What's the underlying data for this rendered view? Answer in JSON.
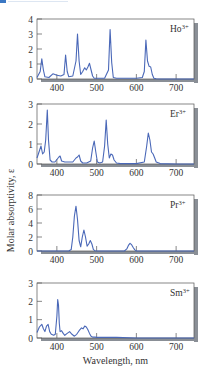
{
  "chart_data": [
    {
      "type": "line",
      "ion_label": "Ho",
      "ion_charge": "3+",
      "xlim": [
        350,
        745
      ],
      "ylim": [
        0,
        4
      ],
      "yticks": [
        "0",
        "1",
        "2",
        "3",
        "4"
      ],
      "xticks": [
        "400",
        "500",
        "600",
        "700"
      ],
      "x": [
        350,
        358,
        362,
        366,
        370,
        380,
        390,
        400,
        410,
        418,
        422,
        426,
        430,
        440,
        448,
        452,
        456,
        460,
        465,
        470,
        474,
        478,
        482,
        486,
        490,
        494,
        500,
        510,
        520,
        530,
        534,
        538,
        542,
        550,
        560,
        580,
        600,
        615,
        620,
        624,
        628,
        632,
        636,
        640,
        644,
        650,
        660,
        700,
        745
      ],
      "values": [
        0.1,
        0.5,
        1.35,
        0.6,
        0.15,
        0.1,
        0.35,
        0.25,
        0.2,
        0.3,
        1.6,
        0.5,
        0.15,
        0.2,
        1.2,
        3.0,
        1.2,
        0.3,
        0.5,
        0.75,
        0.6,
        0.8,
        1.05,
        0.6,
        0.2,
        0.05,
        0.05,
        0.05,
        0.05,
        0.6,
        3.3,
        1.1,
        0.1,
        0.05,
        0.05,
        0.05,
        0.05,
        0.1,
        0.5,
        2.6,
        1.2,
        0.85,
        0.8,
        0.3,
        0.05,
        0.02,
        0.0,
        0.0,
        0.0
      ]
    },
    {
      "type": "line",
      "ion_label": "Er",
      "ion_charge": "3+",
      "xlim": [
        350,
        745
      ],
      "ylim": [
        0,
        3
      ],
      "yticks": [
        "0",
        "1",
        "2",
        "3"
      ],
      "xticks": [
        "400",
        "500",
        "600",
        "700"
      ],
      "x": [
        350,
        355,
        360,
        364,
        368,
        372,
        376,
        379,
        383,
        388,
        395,
        405,
        408,
        412,
        420,
        440,
        448,
        452,
        456,
        460,
        465,
        475,
        485,
        490,
        494,
        498,
        502,
        508,
        515,
        520,
        524,
        528,
        532,
        536,
        540,
        544,
        550,
        560,
        600,
        620,
        626,
        630,
        634,
        638,
        642,
        646,
        650,
        660,
        700,
        745
      ],
      "values": [
        0.3,
        0.6,
        0.9,
        0.5,
        0.6,
        1.2,
        2.7,
        1.2,
        0.2,
        0.1,
        0.1,
        0.35,
        0.4,
        0.15,
        0.1,
        0.1,
        0.3,
        0.35,
        0.45,
        0.15,
        0.05,
        0.05,
        0.15,
        0.8,
        1.15,
        0.6,
        0.1,
        0.05,
        0.1,
        0.9,
        2.2,
        1.0,
        0.3,
        0.5,
        0.45,
        0.2,
        0.05,
        0.02,
        0.02,
        0.1,
        0.9,
        1.55,
        1.2,
        0.6,
        0.5,
        0.3,
        0.1,
        0.02,
        0.0,
        0.0
      ]
    },
    {
      "type": "line",
      "ion_label": "Pr",
      "ion_charge": "3+",
      "xlim": [
        350,
        745
      ],
      "ylim": [
        0,
        8
      ],
      "yticks": [
        "0",
        "2",
        "4",
        "6",
        "8"
      ],
      "xticks": [
        "400",
        "500",
        "600",
        "700"
      ],
      "x": [
        350,
        400,
        430,
        436,
        440,
        444,
        448,
        452,
        456,
        460,
        464,
        468,
        472,
        476,
        480,
        484,
        488,
        492,
        496,
        500,
        570,
        576,
        580,
        584,
        588,
        592,
        596,
        600,
        650,
        745
      ],
      "values": [
        0.0,
        0.0,
        0.0,
        0.2,
        2.0,
        5.0,
        6.4,
        4.5,
        1.5,
        0.6,
        2.0,
        3.0,
        2.0,
        0.7,
        1.0,
        1.5,
        1.0,
        0.2,
        0.05,
        0.0,
        0.0,
        0.3,
        0.8,
        1.1,
        0.9,
        0.5,
        0.15,
        0.0,
        0.0,
        0.0
      ]
    },
    {
      "type": "line",
      "ion_label": "Sm",
      "ion_charge": "3+",
      "xlim": [
        350,
        745
      ],
      "ylim": [
        0,
        3
      ],
      "yticks": [
        "0",
        "1",
        "2",
        "3"
      ],
      "xticks": [
        "400",
        "500",
        "600",
        "700"
      ],
      "x": [
        350,
        356,
        362,
        366,
        370,
        374,
        378,
        382,
        386,
        392,
        396,
        400,
        402,
        404,
        406,
        408,
        412,
        416,
        420,
        426,
        432,
        438,
        444,
        450,
        456,
        462,
        466,
        470,
        474,
        478,
        482,
        486,
        490,
        496,
        500,
        520,
        550,
        600,
        700,
        745
      ],
      "values": [
        0.3,
        0.6,
        0.75,
        0.5,
        0.35,
        0.65,
        0.75,
        0.35,
        0.2,
        0.15,
        0.2,
        1.2,
        2.1,
        1.8,
        0.8,
        0.35,
        0.4,
        0.25,
        0.15,
        0.25,
        0.35,
        0.2,
        0.1,
        0.2,
        0.4,
        0.55,
        0.5,
        0.65,
        0.6,
        0.45,
        0.25,
        0.1,
        0.05,
        0.05,
        0.03,
        0.03,
        0.03,
        0.0,
        0.0,
        0.0
      ]
    }
  ],
  "ylabel": "Molar absorptivity, ε",
  "xlabel": "Wavelength, nm",
  "line_color": "#4a68b8"
}
